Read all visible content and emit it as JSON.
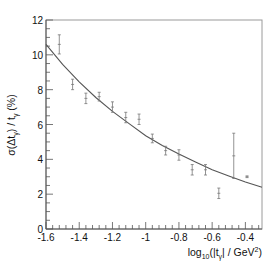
{
  "chart_data": {
    "type": "scatter",
    "title": "",
    "xlabel": "log10(|t_γ| / GeV²)",
    "xlabel_parts": {
      "pre": "log",
      "sub": "10",
      "mid": "(|t",
      "sub2": "γ",
      "post": "| / GeV",
      "sup": "2",
      "end": ")"
    },
    "ylabel": "σ(Δt_γ) / t_γ   (%)",
    "ylabel_parts": {
      "pre": "σ(Δt",
      "sub": "γ",
      "mid": ") / t",
      "sub2": "γ",
      "end": "   (%)"
    },
    "xlim": [
      -1.6,
      -0.3
    ],
    "ylim": [
      0,
      12
    ],
    "xticks": [
      -1.6,
      -1.4,
      -1.2,
      -1,
      -0.8,
      -0.6,
      -0.4
    ],
    "xtick_labels": [
      "-1.6",
      "-1.4",
      "-1.2",
      "-1",
      "-0.8",
      "-0.6",
      "-0.4"
    ],
    "yticks": [
      0,
      2,
      4,
      6,
      8,
      10,
      12
    ],
    "ytick_labels": [
      "0",
      "2",
      "4",
      "6",
      "8",
      "10",
      "12"
    ],
    "grid": false,
    "series": [
      {
        "name": "data",
        "kind": "points_with_errors",
        "x": [
          -1.52,
          -1.44,
          -1.36,
          -1.28,
          -1.2,
          -1.12,
          -1.04,
          -0.96,
          -0.88,
          -0.8,
          -0.72,
          -0.64,
          -0.56,
          -0.47,
          -0.39
        ],
        "y": [
          10.6,
          8.3,
          7.5,
          7.6,
          7.0,
          6.4,
          6.3,
          5.2,
          4.5,
          4.25,
          3.4,
          3.4,
          2.05,
          4.2,
          3.0
        ],
        "err": [
          0.55,
          0.3,
          0.3,
          0.25,
          0.3,
          0.3,
          0.3,
          0.25,
          0.25,
          0.3,
          0.3,
          0.3,
          0.3,
          1.3,
          0.05
        ]
      },
      {
        "name": "fit",
        "kind": "line",
        "x": [
          -1.6,
          -1.5,
          -1.4,
          -1.3,
          -1.2,
          -1.1,
          -1.0,
          -0.9,
          -0.8,
          -0.7,
          -0.6,
          -0.5,
          -0.4,
          -0.3
        ],
        "y": [
          10.6,
          9.45,
          8.45,
          7.55,
          6.75,
          6.05,
          5.35,
          4.8,
          4.3,
          3.85,
          3.4,
          3.05,
          2.7,
          2.4
        ]
      }
    ]
  }
}
